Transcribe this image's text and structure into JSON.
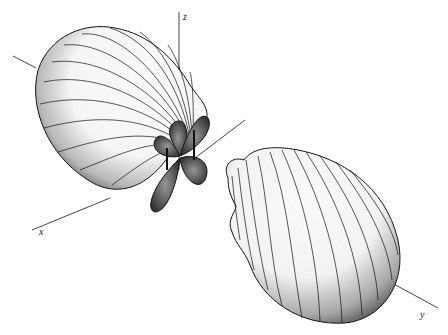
{
  "figure": {
    "type": "3D surface plot (two large lobes with small central lobes)",
    "axes": [
      {
        "name": "x-axis",
        "label": "x"
      },
      {
        "name": "y-axis",
        "label": "y"
      },
      {
        "name": "z-axis",
        "label": "z"
      }
    ],
    "elements": {
      "upper_left_lobe": "large shaded lobe extending toward upper-left with meridian lines",
      "lower_right_lobe": "large shaded lobe extending toward lower-right along y-axis",
      "central_lobes": "four small dark petal lobes at origin"
    },
    "colors": {
      "background": "#ffffff",
      "ink": "#111111",
      "shade": "#555555"
    }
  }
}
